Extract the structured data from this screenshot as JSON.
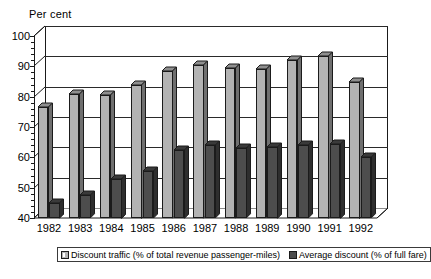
{
  "chart_data": {
    "type": "bar",
    "title": "",
    "subtitle": "",
    "xlabel": "",
    "ylabel": "Per cent",
    "ylim": [
      40,
      100
    ],
    "ytick_step": 10,
    "yticks": [
      40,
      50,
      60,
      70,
      80,
      90,
      100
    ],
    "grid": true,
    "legend_position": "bottom",
    "style": "3d-column",
    "categories": [
      "1982",
      "1983",
      "1984",
      "1985",
      "1986",
      "1987",
      "1988",
      "1989",
      "1990",
      "1991",
      "1992"
    ],
    "series": [
      {
        "name": "Discount traffic (% of total revenue passenger-miles)",
        "color": "#b3b3b3",
        "values": [
          76.5,
          81,
          80.5,
          84,
          88.5,
          90.5,
          89.5,
          89,
          92,
          93.5,
          85
        ]
      },
      {
        "name": "Average discount (% of full fare)",
        "color": "#4d4d4d",
        "values": [
          45,
          47.5,
          53,
          55.5,
          62.5,
          64,
          63,
          63.5,
          64,
          64.5,
          60
        ]
      }
    ]
  },
  "axis": {
    "y_title": "Per cent",
    "y_tick_labels": [
      "100",
      "90",
      "80",
      "70",
      "60",
      "50",
      "40"
    ],
    "x_tick_labels": [
      "1982",
      "1983",
      "1984",
      "1985",
      "1986",
      "1987",
      "1988",
      "1989",
      "1990",
      "1991",
      "1992"
    ]
  },
  "legend": {
    "items": [
      {
        "label": "Discount traffic (% of total revenue passenger-miles)",
        "swatch": "light-gray-swatch"
      },
      {
        "label": "Average discount (% of full fare)",
        "swatch": "dark-gray-swatch"
      }
    ]
  },
  "colors": {
    "series_light": "#b3b3b3",
    "series_dark": "#4d4d4d",
    "axis": "#1a1a1a",
    "grid": "#2a2a2a",
    "background": "#ffffff"
  }
}
